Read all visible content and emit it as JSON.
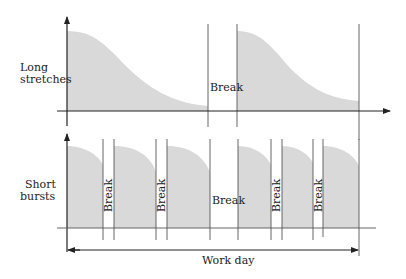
{
  "diagram": {
    "top_panel": {
      "label_line1": "Long",
      "label_line2": "stretches",
      "break_label": "Break",
      "segments": [
        {
          "type": "work",
          "x_start": 67,
          "x_end": 208
        },
        {
          "type": "break",
          "x_start": 208,
          "x_end": 237
        },
        {
          "type": "work",
          "x_start": 237,
          "x_end": 359
        }
      ]
    },
    "bottom_panel": {
      "label_line1": "Short",
      "label_line2": "bursts",
      "break_label": "Break",
      "segments": [
        {
          "type": "work",
          "x_start": 67,
          "x_end": 103
        },
        {
          "type": "break",
          "x_start": 103,
          "x_end": 114,
          "orientation": "vertical"
        },
        {
          "type": "work",
          "x_start": 114,
          "x_end": 156
        },
        {
          "type": "break",
          "x_start": 156,
          "x_end": 167,
          "orientation": "vertical"
        },
        {
          "type": "work",
          "x_start": 167,
          "x_end": 210
        },
        {
          "type": "break",
          "x_start": 210,
          "x_end": 238,
          "orientation": "horizontal"
        },
        {
          "type": "work",
          "x_start": 238,
          "x_end": 271
        },
        {
          "type": "break",
          "x_start": 271,
          "x_end": 282,
          "orientation": "vertical"
        },
        {
          "type": "work",
          "x_start": 282,
          "x_end": 313
        },
        {
          "type": "break",
          "x_start": 313,
          "x_end": 323,
          "orientation": "vertical"
        },
        {
          "type": "work",
          "x_start": 323,
          "x_end": 359
        }
      ]
    },
    "span": {
      "label": "Work day"
    },
    "colors": {
      "fill": "#d9d9d9",
      "line": "#222222"
    }
  }
}
